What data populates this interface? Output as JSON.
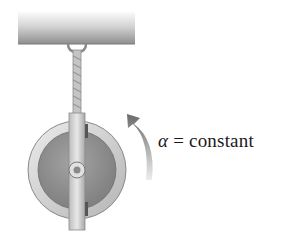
{
  "diagram": {
    "label": {
      "symbol": "α",
      "equals": " = ",
      "text": "constant"
    },
    "colors": {
      "beam_light": "#f2f2f2",
      "beam_dark": "#9a9a9a",
      "rope": "#b8b8b8",
      "wheel_rim": "#d6d6d6",
      "wheel_face": "#8c8c8c",
      "axle_bar": "#cfcfcf",
      "arrow_dark": "#707070",
      "arrow_light": "#e4e4e4"
    }
  }
}
